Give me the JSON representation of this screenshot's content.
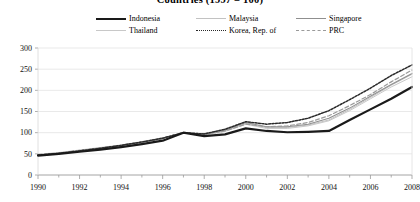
{
  "title": "Countries (1997 = 100)",
  "legend": {
    "position": "top",
    "items": [
      {
        "label": "Indonesia",
        "style": "thick-solid",
        "color": "#1a1a1a"
      },
      {
        "label": "Malaysia",
        "style": "thin-solid",
        "color": "#c2c2c2"
      },
      {
        "label": "Singapore",
        "style": "thin-solid",
        "color": "#8f8f8f"
      },
      {
        "label": "Thailand",
        "style": "thin-solid",
        "color": "#c8c8c8"
      },
      {
        "label": "Korea, Rep. of",
        "style": "dotted",
        "color": "#2a2a2a"
      },
      {
        "label": "PRC",
        "style": "dashed",
        "color": "#9a9a9a"
      }
    ]
  },
  "axes": {
    "y_ticks": [
      "0",
      "50",
      "100",
      "150",
      "200",
      "250",
      "300"
    ],
    "x_ticks": [
      "1990",
      "1992",
      "1994",
      "1996",
      "1998",
      "2000",
      "2002",
      "2004",
      "2006",
      "2008"
    ]
  },
  "chart_data": {
    "type": "line",
    "title": "Countries (1997 = 100)",
    "xlabel": "",
    "ylabel": "",
    "ylim": [
      0,
      300
    ],
    "xlim": [
      1990,
      2008
    ],
    "grid": true,
    "legend_position": "top",
    "x": [
      1990,
      1991,
      1992,
      1993,
      1994,
      1995,
      1996,
      1997,
      1998,
      1999,
      2000,
      2001,
      2002,
      2003,
      2004,
      2005,
      2006,
      2007,
      2008
    ],
    "series": [
      {
        "name": "Indonesia",
        "values": [
          46,
          50,
          55,
          60,
          66,
          73,
          81,
          100,
          92,
          96,
          110,
          104,
          101,
          102,
          104,
          130,
          155,
          180,
          208
        ]
      },
      {
        "name": "Malaysia",
        "values": [
          48,
          52,
          58,
          64,
          70,
          78,
          87,
          100,
          95,
          105,
          122,
          112,
          112,
          118,
          130,
          155,
          183,
          212,
          238
        ]
      },
      {
        "name": "Singapore",
        "values": [
          47,
          51,
          57,
          63,
          70,
          77,
          86,
          100,
          96,
          106,
          124,
          114,
          114,
          120,
          134,
          158,
          186,
          214,
          240
        ]
      },
      {
        "name": "Thailand",
        "values": [
          49,
          53,
          59,
          65,
          71,
          79,
          88,
          100,
          94,
          103,
          120,
          110,
          110,
          116,
          128,
          152,
          180,
          208,
          232
        ]
      },
      {
        "name": "Korea, Rep. of",
        "values": [
          47,
          51,
          57,
          63,
          70,
          78,
          87,
          100,
          97,
          108,
          126,
          120,
          124,
          134,
          152,
          178,
          205,
          235,
          260
        ]
      },
      {
        "name": "PRC",
        "values": [
          48,
          52,
          58,
          64,
          70,
          78,
          87,
          100,
          96,
          104,
          120,
          114,
          116,
          124,
          140,
          164,
          190,
          220,
          248
        ]
      }
    ]
  }
}
